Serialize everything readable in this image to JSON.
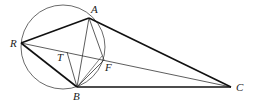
{
  "diagram": {
    "type": "geometry",
    "circle": {
      "cx": 63,
      "cy": 47,
      "r": 42
    },
    "points": {
      "A": {
        "label": "A",
        "x": 89,
        "y": 18,
        "lx": 91,
        "ly": 13
      },
      "R": {
        "label": "R",
        "x": 21,
        "y": 43,
        "lx": 10,
        "ly": 47
      },
      "B": {
        "label": "B",
        "x": 77,
        "y": 87,
        "lx": 73,
        "ly": 100
      },
      "C": {
        "label": "C",
        "x": 231,
        "y": 87,
        "lx": 236,
        "ly": 91
      },
      "F": {
        "label": "F",
        "x": 104,
        "y": 60,
        "lx": 105,
        "ly": 71
      },
      "T": {
        "label": "T",
        "x": 67,
        "y": 52,
        "lx": 57,
        "ly": 61
      }
    },
    "thick_segments": [
      [
        "R",
        "A"
      ],
      [
        "A",
        "C"
      ],
      [
        "R",
        "B"
      ],
      [
        "B",
        "C"
      ]
    ],
    "thin_segments": [
      [
        "R",
        "C"
      ],
      [
        "A",
        "B"
      ],
      [
        "A",
        "F"
      ],
      [
        "B",
        "F"
      ],
      [
        "T",
        "B"
      ]
    ],
    "stroke_color": "#222222"
  }
}
